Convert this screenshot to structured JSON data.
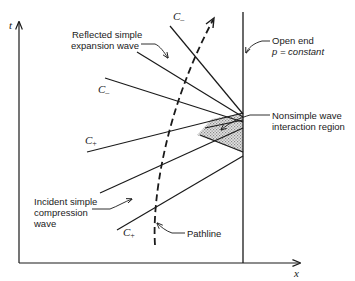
{
  "diagram": {
    "axes": {
      "vertical_label": "t",
      "horizontal_label": "x"
    },
    "labels": {
      "reflected_wave_line1": "Reflected simple",
      "reflected_wave_line2": "expansion wave",
      "open_end_line1": "Open end",
      "open_end_line2": "p = constant",
      "interaction_line1": "Nonsimple wave",
      "interaction_line2": "interaction region",
      "incident_line1": "Incident simple",
      "incident_line2": "compression",
      "incident_line3": "wave",
      "pathline": "Pathline"
    },
    "characteristics": {
      "c_minus_top": {
        "letter": "C",
        "sub": "–"
      },
      "c_minus_mid": {
        "letter": "C",
        "sub": "–"
      },
      "c_plus_mid": {
        "letter": "C",
        "sub": "+"
      },
      "c_plus_bottom": {
        "letter": "C",
        "sub": "+"
      }
    },
    "colors": {
      "ink": "#1a1a1a",
      "shading": "#c8c8c8"
    }
  }
}
